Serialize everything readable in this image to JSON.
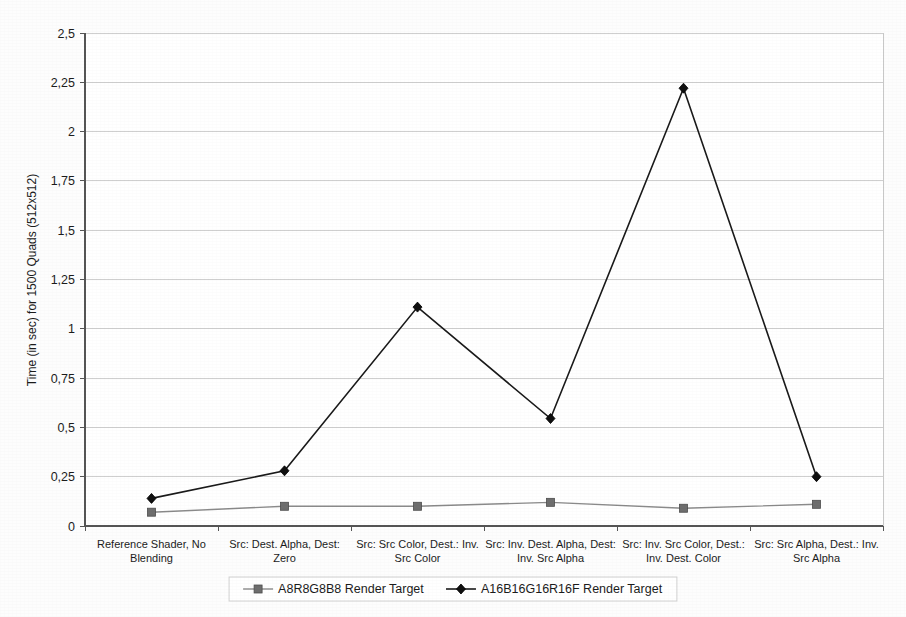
{
  "chart_data": {
    "type": "line",
    "title": "",
    "xlabel": "",
    "ylabel": "Time (in sec) for 1500 Quads (512x512)",
    "ylim": [
      0,
      2.5
    ],
    "ytick_step": 0.25,
    "decimal_separator": ",",
    "grid": true,
    "legend_position": "bottom",
    "ytick_labels": [
      "0",
      "0,25",
      "0,5",
      "0,75",
      "1",
      "1,25",
      "1,5",
      "1,75",
      "2",
      "2,25",
      "2,5"
    ],
    "ytick_values": [
      0,
      0.25,
      0.5,
      0.75,
      1,
      1.25,
      1.5,
      1.75,
      2,
      2.25,
      2.5
    ],
    "categories": [
      "Reference Shader, No Blending",
      "Src: Dest. Alpha, Dest: Zero",
      "Src: Src Color, Dest.: Inv. Src Color",
      "Src: Inv. Dest. Alpha, Dest: Inv. Src Alpha",
      "Src: Inv. Src Color, Dest.: Inv. Dest. Color",
      "Src: Src Alpha, Dest.: Inv. Src Alpha"
    ],
    "categories_lines": [
      [
        "Reference Shader, No",
        "Blending"
      ],
      [
        "Src: Dest. Alpha, Dest:",
        "Zero"
      ],
      [
        "Src: Src Color, Dest.: Inv.",
        "Src Color"
      ],
      [
        "Src: Inv. Dest. Alpha, Dest:",
        "Inv. Src Alpha"
      ],
      [
        "Src: Inv. Src Color, Dest.:",
        "Inv. Dest. Color"
      ],
      [
        "Src: Src Alpha, Dest.: Inv.",
        "Src Alpha"
      ]
    ],
    "series": [
      {
        "name": "A8R8G8B8 Render Target",
        "marker": "square",
        "color": "#6e6e6e",
        "line_color": "#8a8a8a",
        "values": [
          0.07,
          0.1,
          0.1,
          0.12,
          0.09,
          0.11
        ]
      },
      {
        "name": "A16B16G16R16F Render Target",
        "marker": "diamond",
        "color": "#101010",
        "line_color": "#1a1a1a",
        "values": [
          0.14,
          0.28,
          1.11,
          0.545,
          2.22,
          0.25
        ]
      }
    ]
  },
  "legend": {
    "items": [
      {
        "label": "A8R8G8B8 Render Target",
        "marker": "square"
      },
      {
        "label": "A16B16G16R16F Render Target",
        "marker": "diamond"
      }
    ]
  },
  "colors": {
    "background": "#fdfdfd",
    "grid": "#cfcfcf",
    "axis": "#555555",
    "series_a": "#6e6e6e",
    "series_b": "#101010"
  }
}
